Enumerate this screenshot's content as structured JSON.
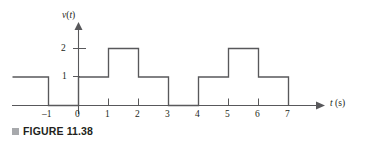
{
  "figure": {
    "caption_bullet": "square-bullet",
    "caption_text": "FIGURE 11.38"
  },
  "axes": {
    "y_axis_label": "v(t)",
    "y_axis_label_var": "v",
    "y_axis_label_paren_open": "(",
    "y_axis_label_arg": "t",
    "y_axis_label_paren_close": ")",
    "x_axis_label": "t (s)",
    "x_axis_label_var": "t",
    "x_axis_label_unit": "(s)",
    "y_ticks": [
      "1",
      "2"
    ],
    "y_tick_values": [
      1,
      2
    ],
    "x_ticks": [
      "-1",
      "0",
      "1",
      "2",
      "3",
      "4",
      "5",
      "6",
      "7"
    ],
    "x_tick_values": [
      -1,
      0,
      1,
      2,
      3,
      4,
      5,
      6,
      7
    ],
    "x_minus_one": "–1",
    "x_zero": "0",
    "x_one": "1",
    "x_two": "2",
    "x_three": "3",
    "x_four": "4",
    "x_five": "5",
    "x_six": "6",
    "x_seven": "7",
    "y_one": "1",
    "y_two": "2"
  },
  "colors": {
    "line": "#58585b",
    "text": "#231f20",
    "bullet": "#a7a9ac",
    "background": "#ffffff"
  },
  "chart_data": {
    "type": "line",
    "title": "",
    "xlabel": "t (s)",
    "ylabel": "v(t)",
    "xlim": [
      -2,
      8
    ],
    "ylim": [
      0,
      2.6
    ],
    "grid": false,
    "legend": null,
    "series": [
      {
        "name": "v(t)",
        "step": "post",
        "x": [
          -2.2,
          -1,
          -1,
          0,
          0,
          1,
          1,
          2,
          2,
          3,
          3,
          4,
          4,
          5,
          5,
          6,
          6,
          7,
          7
        ],
        "y": [
          1,
          1,
          0,
          0,
          1,
          1,
          2,
          2,
          1,
          1,
          0,
          0,
          1,
          1,
          2,
          2,
          1,
          1,
          0
        ]
      }
    ],
    "segments": [
      {
        "t_start": -2.2,
        "t_end": -1,
        "value": 1
      },
      {
        "t_start": -1,
        "t_end": 0,
        "value": 0
      },
      {
        "t_start": 0,
        "t_end": 1,
        "value": 1
      },
      {
        "t_start": 1,
        "t_end": 2,
        "value": 2
      },
      {
        "t_start": 2,
        "t_end": 3,
        "value": 1
      },
      {
        "t_start": 3,
        "t_end": 4,
        "value": 0
      },
      {
        "t_start": 4,
        "t_end": 5,
        "value": 1
      },
      {
        "t_start": 5,
        "t_end": 6,
        "value": 2
      },
      {
        "t_start": 6,
        "t_end": 7,
        "value": 1
      },
      {
        "t_start": 7,
        "t_end": 8,
        "value": 0
      }
    ]
  }
}
